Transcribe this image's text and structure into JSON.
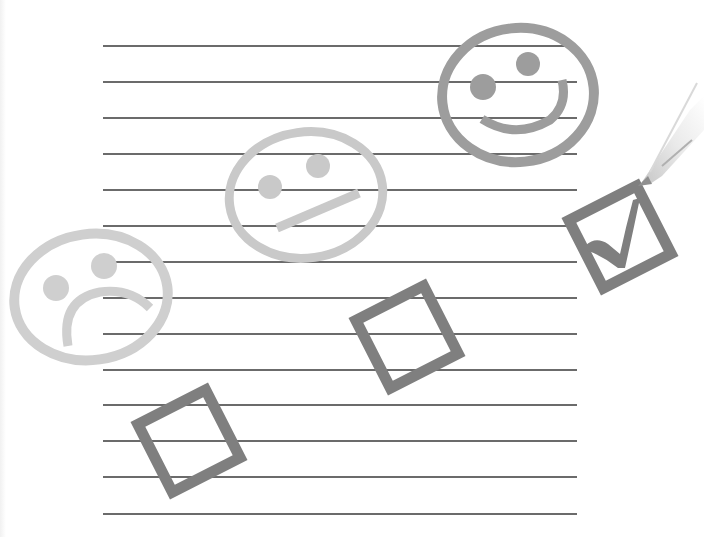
{
  "scene": {
    "description": "Ruled paper with three emoticons (sad, neutral, happy) and three tilted checkboxes; the happy one is ticked by a pen",
    "background_color": "#ffffff",
    "ruled_lines": {
      "count": 14,
      "x_start": 103,
      "x_end": 577,
      "y_positions": [
        46,
        82,
        118,
        154,
        190,
        226,
        262,
        298,
        334,
        370,
        405,
        441,
        477,
        514
      ],
      "color": "#3a3a3a"
    },
    "faces": [
      {
        "mood": "sad",
        "cx": 91,
        "cy": 297,
        "rx": 80,
        "ry": 66,
        "color": "#cfcfcf",
        "eyes": [
          {
            "cx": 56,
            "cy": 288,
            "r": 13
          },
          {
            "cx": 104,
            "cy": 266,
            "r": 13
          }
        ]
      },
      {
        "mood": "neutral",
        "cx": 306,
        "cy": 195,
        "rx": 79,
        "ry": 64,
        "color": "#c9c9c9",
        "eyes": [
          {
            "cx": 270,
            "cy": 187,
            "r": 12
          },
          {
            "cx": 318,
            "cy": 166,
            "r": 12
          }
        ]
      },
      {
        "mood": "happy",
        "cx": 518,
        "cy": 95,
        "rx": 77,
        "ry": 68,
        "color": "#9d9d9d",
        "eyes": [
          {
            "cx": 483,
            "cy": 87,
            "r": 13
          },
          {
            "cx": 528,
            "cy": 64,
            "r": 12
          }
        ]
      }
    ],
    "checkboxes": [
      {
        "option": "sad",
        "checked": false,
        "cx": 189,
        "cy": 441,
        "size": 84,
        "rotation": -27,
        "color": "#7f7f7f"
      },
      {
        "option": "neutral",
        "checked": false,
        "cx": 407,
        "cy": 337,
        "size": 84,
        "rotation": -27,
        "color": "#7f7f7f"
      },
      {
        "option": "happy",
        "checked": true,
        "cx": 620,
        "cy": 237,
        "size": 84,
        "rotation": -27,
        "color": "#7f7f7f"
      }
    ],
    "pen": {
      "tip_x": 645,
      "tip_y": 180,
      "color": "#d8d8d8"
    }
  }
}
